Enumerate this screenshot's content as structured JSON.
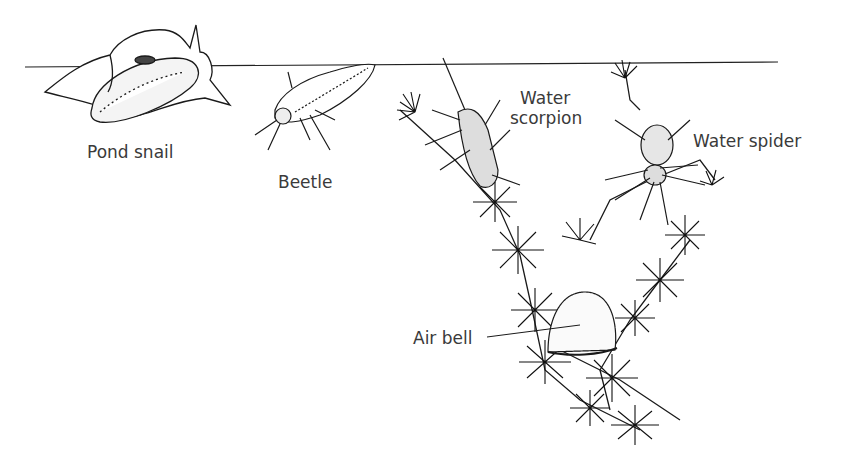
{
  "diagram": {
    "labels": {
      "pond_snail": "Pond snail",
      "beetle": "Beetle",
      "water_scorpion_line1": "Water",
      "water_scorpion_line2": "scorpion",
      "water_spider": "Water spider",
      "air_bell": "Air bell"
    },
    "colors": {
      "ink": "#1a1a1a",
      "label": "#3a3a3a",
      "background": "#ffffff"
    }
  }
}
